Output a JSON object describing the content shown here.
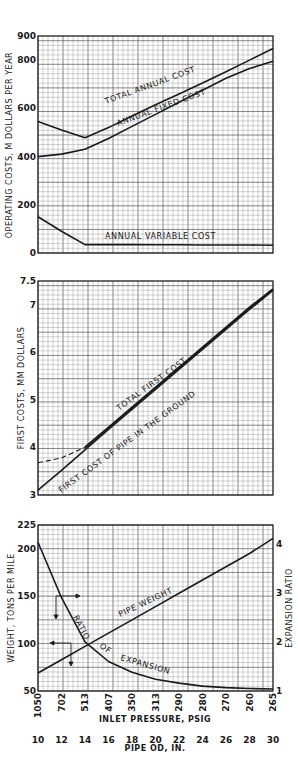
{
  "chart_data": [
    {
      "type": "line",
      "title": "",
      "xlabel": "Pipe OD, in.",
      "ylabel": "OPERATING COSTS, M DOLLARS PER YEAR",
      "ylim": [
        0,
        900
      ],
      "yticks": [
        0,
        200,
        400,
        600,
        800,
        900
      ],
      "xlim": [
        10,
        30
      ],
      "grid": true,
      "x": [
        10,
        12,
        14,
        16,
        18,
        20,
        22,
        24,
        26,
        28,
        30
      ],
      "series": [
        {
          "name": "TOTAL ANNUAL COST",
          "values": [
            545,
            510,
            478,
            520,
            568,
            615,
            660,
            705,
            752,
            800,
            848
          ]
        },
        {
          "name": "ANNUAL FIXED COST",
          "values": [
            400,
            410,
            430,
            475,
            525,
            575,
            625,
            675,
            725,
            765,
            795
          ]
        },
        {
          "name": "ANNUAL VARIABLE COST",
          "values": [
            150,
            90,
            35,
            35,
            35,
            34,
            34,
            33,
            33,
            33,
            32
          ]
        }
      ]
    },
    {
      "type": "line",
      "title": "",
      "xlabel": "Pipe OD, in.",
      "ylabel": "FIRST COSTS, MM DOLLARS",
      "ylim": [
        3,
        7.5
      ],
      "yticks": [
        3,
        4,
        5,
        6,
        7,
        7.5
      ],
      "xlim": [
        10,
        30
      ],
      "grid": true,
      "x": [
        10,
        12,
        14,
        16,
        18,
        20,
        22,
        24,
        26,
        28,
        30
      ],
      "series": [
        {
          "name": "TOTAL FIRST COST",
          "values": [
            3.68,
            3.78,
            4.0,
            4.42,
            4.84,
            5.26,
            5.68,
            6.1,
            6.52,
            6.94,
            7.33
          ]
        },
        {
          "name": "FIRST COST OF PIPE IN THE GROUND",
          "values": [
            3.1,
            3.52,
            3.95,
            4.38,
            4.8,
            5.22,
            5.64,
            6.06,
            6.48,
            6.9,
            7.3
          ]
        }
      ]
    },
    {
      "type": "line",
      "title": "",
      "xlabel": "INLET PRESSURE, PSIG",
      "x2label": "PIPE OD, IN.",
      "ylabel": "WEIGHT, TONS PER MILE",
      "y2label": "EXPANSION RATIO",
      "ylim": [
        50,
        225
      ],
      "yticks": [
        50,
        100,
        150,
        200,
        225
      ],
      "y2lim": [
        1,
        4.38
      ],
      "y2ticks": [
        1,
        2,
        3,
        4
      ],
      "xlim": [
        10,
        30
      ],
      "grid": true,
      "x": [
        10,
        12,
        14,
        16,
        18,
        20,
        22,
        24,
        26,
        28,
        30
      ],
      "inlet_pressure_ticks": [
        "1050",
        "702",
        "513",
        "407",
        "350",
        "313",
        "290",
        "280",
        "270",
        "260",
        "265"
      ],
      "pipe_od_ticks": [
        "10",
        "12",
        "14",
        "16",
        "18",
        "20",
        "22",
        "24",
        "26",
        "28",
        "30"
      ],
      "series": [
        {
          "name": "PIPE WEIGHT",
          "axis": "left",
          "values": [
            69,
            83,
            97,
            111,
            125,
            139,
            153,
            167,
            181,
            195,
            211
          ]
        },
        {
          "name": "RATIO OF EXPANSION",
          "axis": "right",
          "values": [
            4.03,
            2.9,
            2.0,
            1.6,
            1.38,
            1.24,
            1.16,
            1.1,
            1.07,
            1.05,
            1.04
          ]
        }
      ]
    }
  ],
  "labels": {
    "c1_ylabel": "OPERATING  COSTS,  M  DOLLARS  PER  YEAR",
    "c1_total": "TOTAL  ANNUAL  COST",
    "c1_fixed": "ANNUAL  FIXED  COST",
    "c1_variable": "ANNUAL  VARIABLE  COST",
    "c2_ylabel": "FIRST  COSTS,  MM  DOLLARS",
    "c2_total": "TOTAL  FIRST  COST",
    "c2_pipe": "FIRST  COST  OF  PIPE  IN  THE  GROUND",
    "c3_ylabel": "WEIGHT,  TONS  PER  MILE",
    "c3_y2label": "EXPANSION  RATIO",
    "c3_weight": "PIPE  WEIGHT",
    "c3_ratio1": "RATIO",
    "c3_ratio2": "OF",
    "c3_ratio3": "EXPANSION",
    "xlabel_pressure": "INLET  PRESSURE,  PSIG",
    "xlabel_od": "PIPE  OD,  IN."
  },
  "colors": {
    "ink": "#1a1a1a",
    "grid_minor": "#9a9a9a",
    "grid_major": "#555555",
    "background": "#ffffff"
  }
}
